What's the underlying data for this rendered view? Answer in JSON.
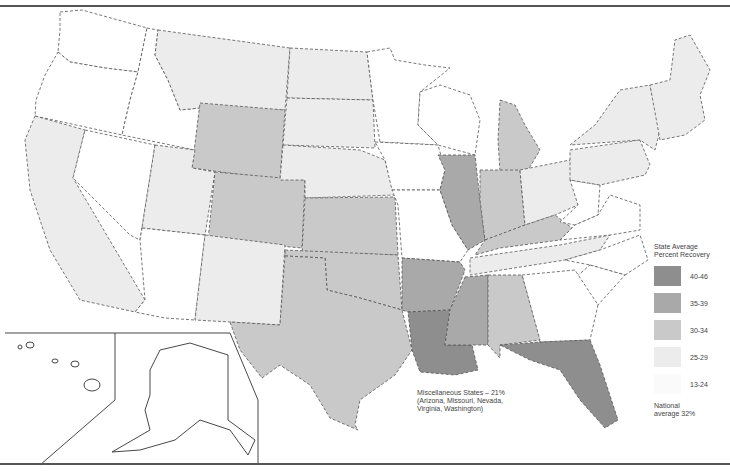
{
  "legend": {
    "title_line1": "State Average",
    "title_line2": "Percent Recovery",
    "items": [
      {
        "range": "40-46",
        "color": "#8e8e8e"
      },
      {
        "range": "35-39",
        "color": "#a9a9a9"
      },
      {
        "range": "30-34",
        "color": "#c9c9c9"
      },
      {
        "range": "25-29",
        "color": "#ececec"
      },
      {
        "range": "13-24",
        "color": "#fafafa"
      }
    ],
    "national_line1": "National",
    "national_line2": "average 32%"
  },
  "note": {
    "line1": "Miscellaneous States  –  21%",
    "line2": "(Arizona, Missouri, Nevada,",
    "line3": "Virginia, Washington)"
  },
  "states": {
    "40-46": [
      "Louisiana",
      "Florida"
    ],
    "35-39": [
      "Illinois",
      "Arkansas",
      "Mississippi",
      "Alaska"
    ],
    "30-34": [
      "Wyoming",
      "Colorado",
      "Kansas",
      "Oklahoma",
      "Texas",
      "Michigan",
      "Indiana",
      "Kentucky",
      "Alabama"
    ],
    "25-29": [
      "Montana",
      "North Dakota",
      "South Dakota",
      "Nebraska",
      "California",
      "Utah",
      "New Mexico",
      "Ohio",
      "Pennsylvania",
      "New York",
      "Tennessee",
      "New England"
    ],
    "unshaded": [
      "Washington",
      "Oregon",
      "Idaho",
      "Nevada",
      "Arizona",
      "Minnesota",
      "Wisconsin",
      "Iowa",
      "Missouri",
      "West Virginia",
      "Virginia",
      "North Carolina",
      "South Carolina",
      "Georgia",
      "Hawaii"
    ]
  }
}
